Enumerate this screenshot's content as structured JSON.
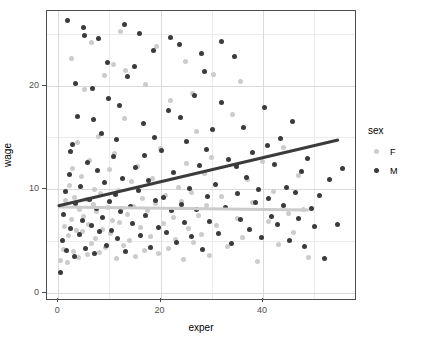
{
  "chart_data": {
    "type": "scatter",
    "title": "",
    "xlabel": "exper",
    "ylabel": "wage",
    "xlim": [
      -2.2,
      58
    ],
    "ylim": [
      -0.6,
      27.2
    ],
    "x_ticks": [
      0,
      20,
      40
    ],
    "y_ticks": [
      0,
      10,
      20
    ],
    "x_minor_ticks": [
      10,
      30,
      50
    ],
    "y_minor_ticks": [
      5,
      15,
      25
    ],
    "grid": true,
    "legend": {
      "title": "sex",
      "position": "right",
      "entries": [
        {
          "label": "F",
          "color": "#cccccc"
        },
        {
          "label": "M",
          "color": "#3b3b3b"
        }
      ]
    },
    "series": [
      {
        "name": "F",
        "color": "#cccccc",
        "fit_line": {
          "x0": 0,
          "y0": 8.3,
          "x1": 49,
          "y1": 8.0,
          "color": "#cccccc"
        },
        "points": [
          [
            0.5,
            3.1
          ],
          [
            1.0,
            4.2
          ],
          [
            1.2,
            6.4
          ],
          [
            1.5,
            8.9
          ],
          [
            1.8,
            2.9
          ],
          [
            2.0,
            5.5
          ],
          [
            2.2,
            10.4
          ],
          [
            2.5,
            7.1
          ],
          [
            2.8,
            12.0
          ],
          [
            3.0,
            4.0
          ],
          [
            3.2,
            9.2
          ],
          [
            3.5,
            6.0
          ],
          [
            3.8,
            14.5
          ],
          [
            4.0,
            3.4
          ],
          [
            4.2,
            8.0
          ],
          [
            4.5,
            11.2
          ],
          [
            4.8,
            5.9
          ],
          [
            5.0,
            7.4
          ],
          [
            5.2,
            19.6
          ],
          [
            5.5,
            9.0
          ],
          [
            5.8,
            3.7
          ],
          [
            6.0,
            6.6
          ],
          [
            6.2,
            12.8
          ],
          [
            6.5,
            4.8
          ],
          [
            6.8,
            8.5
          ],
          [
            7.0,
            10.0
          ],
          [
            7.2,
            5.2
          ],
          [
            7.5,
            7.8
          ],
          [
            7.8,
            15.1
          ],
          [
            8.0,
            3.9
          ],
          [
            8.3,
            9.6
          ],
          [
            8.6,
            6.1
          ],
          [
            9.0,
            21.0
          ],
          [
            9.3,
            4.4
          ],
          [
            9.6,
            8.2
          ],
          [
            10.0,
            11.9
          ],
          [
            10.3,
            5.7
          ],
          [
            10.6,
            7.0
          ],
          [
            11.0,
            13.4
          ],
          [
            11.4,
            3.3
          ],
          [
            11.8,
            9.9
          ],
          [
            12.0,
            6.8
          ],
          [
            12.4,
            8.1
          ],
          [
            12.8,
            4.6
          ],
          [
            13.0,
            16.8
          ],
          [
            13.5,
            7.6
          ],
          [
            14.0,
            5.0
          ],
          [
            14.4,
            10.7
          ],
          [
            14.8,
            8.3
          ],
          [
            15.0,
            3.5
          ],
          [
            15.5,
            12.2
          ],
          [
            16.0,
            6.3
          ],
          [
            16.4,
            9.1
          ],
          [
            16.8,
            4.1
          ],
          [
            17.0,
            20.1
          ],
          [
            17.5,
            7.9
          ],
          [
            18.0,
            5.4
          ],
          [
            18.5,
            11.0
          ],
          [
            19.0,
            8.6
          ],
          [
            19.5,
            3.8
          ],
          [
            20.0,
            13.9
          ],
          [
            20.5,
            6.7
          ],
          [
            21.0,
            9.4
          ],
          [
            21.5,
            4.3
          ],
          [
            22.0,
            18.6
          ],
          [
            22.5,
            7.3
          ],
          [
            23.0,
            5.1
          ],
          [
            23.5,
            10.2
          ],
          [
            24.0,
            8.8
          ],
          [
            24.5,
            3.2
          ],
          [
            25.0,
            12.5
          ],
          [
            25.5,
            6.2
          ],
          [
            26.0,
            9.7
          ],
          [
            26.5,
            4.9
          ],
          [
            27.0,
            15.6
          ],
          [
            27.5,
            7.5
          ],
          [
            28.0,
            5.6
          ],
          [
            28.5,
            11.5
          ],
          [
            29.0,
            8.4
          ],
          [
            29.5,
            3.6
          ],
          [
            30.0,
            13.1
          ],
          [
            31.0,
            6.5
          ],
          [
            32.0,
            9.3
          ],
          [
            33.0,
            4.5
          ],
          [
            34.0,
            17.2
          ],
          [
            35.0,
            7.2
          ],
          [
            36.0,
            5.3
          ],
          [
            37.0,
            10.9
          ],
          [
            38.0,
            8.7
          ],
          [
            39.0,
            3.0
          ],
          [
            40.0,
            12.7
          ],
          [
            41.0,
            6.9
          ],
          [
            42.0,
            9.8
          ],
          [
            43.0,
            4.7
          ],
          [
            44.0,
            14.0
          ],
          [
            45.0,
            7.7
          ],
          [
            46.0,
            5.8
          ],
          [
            47.0,
            11.3
          ],
          [
            48.0,
            8.0
          ],
          [
            49.0,
            3.4
          ],
          [
            2.6,
            22.6
          ],
          [
            6.4,
            24.2
          ],
          [
            10.8,
            22.0
          ],
          [
            13.2,
            21.5
          ],
          [
            19.2,
            23.8
          ],
          [
            24.8,
            22.3
          ],
          [
            30.4,
            21.1
          ],
          [
            35.6,
            20.4
          ],
          [
            12.2,
            25.2
          ],
          [
            26.2,
            19.2
          ]
        ]
      },
      {
        "name": "M",
        "color": "#3b3b3b",
        "fit_line": {
          "x0": 0,
          "y0": 8.4,
          "x1": 55,
          "y1": 14.8,
          "color": "#3b3b3b"
        },
        "points": [
          [
            0.4,
            2.0
          ],
          [
            0.8,
            5.0
          ],
          [
            1.1,
            7.6
          ],
          [
            1.4,
            9.8
          ],
          [
            1.7,
            4.1
          ],
          [
            2.1,
            11.4
          ],
          [
            2.4,
            6.2
          ],
          [
            2.7,
            14.3
          ],
          [
            3.1,
            3.5
          ],
          [
            3.4,
            8.6
          ],
          [
            3.7,
            17.0
          ],
          [
            4.1,
            5.6
          ],
          [
            4.4,
            10.3
          ],
          [
            4.7,
            7.0
          ],
          [
            5.1,
            24.8
          ],
          [
            5.4,
            4.3
          ],
          [
            5.7,
            12.6
          ],
          [
            6.1,
            9.0
          ],
          [
            6.4,
            6.5
          ],
          [
            6.7,
            19.7
          ],
          [
            7.1,
            3.8
          ],
          [
            7.4,
            8.1
          ],
          [
            7.7,
            11.8
          ],
          [
            8.1,
            5.9
          ],
          [
            8.4,
            15.4
          ],
          [
            8.7,
            7.3
          ],
          [
            9.1,
            10.6
          ],
          [
            9.4,
            4.6
          ],
          [
            9.7,
            22.2
          ],
          [
            10.1,
            8.8
          ],
          [
            10.4,
            6.0
          ],
          [
            10.8,
            13.2
          ],
          [
            11.1,
            9.5
          ],
          [
            11.5,
            5.2
          ],
          [
            11.9,
            18.1
          ],
          [
            12.2,
            7.8
          ],
          [
            12.6,
            11.0
          ],
          [
            13.1,
            4.0
          ],
          [
            13.6,
            20.9
          ],
          [
            14.1,
            8.3
          ],
          [
            14.6,
            6.7
          ],
          [
            15.1,
            12.1
          ],
          [
            15.6,
            9.9
          ],
          [
            16.1,
            5.5
          ],
          [
            16.6,
            16.3
          ],
          [
            17.1,
            7.5
          ],
          [
            17.6,
            10.8
          ],
          [
            18.1,
            4.4
          ],
          [
            18.6,
            23.4
          ],
          [
            19.1,
            8.9
          ],
          [
            19.6,
            6.3
          ],
          [
            20.1,
            13.7
          ],
          [
            20.6,
            9.2
          ],
          [
            21.1,
            5.8
          ],
          [
            21.6,
            17.6
          ],
          [
            22.1,
            7.9
          ],
          [
            22.6,
            11.6
          ],
          [
            23.1,
            4.9
          ],
          [
            23.6,
            24.0
          ],
          [
            24.1,
            8.5
          ],
          [
            24.6,
            6.8
          ],
          [
            25.1,
            14.6
          ],
          [
            25.6,
            10.1
          ],
          [
            26.1,
            5.4
          ],
          [
            26.6,
            19.0
          ],
          [
            27.1,
            8.0
          ],
          [
            27.6,
            12.3
          ],
          [
            28.1,
            4.2
          ],
          [
            28.6,
            21.4
          ],
          [
            29.1,
            9.3
          ],
          [
            29.6,
            6.9
          ],
          [
            30.2,
            15.8
          ],
          [
            30.8,
            10.5
          ],
          [
            31.4,
            5.7
          ],
          [
            32.0,
            18.4
          ],
          [
            32.6,
            8.2
          ],
          [
            33.2,
            12.9
          ],
          [
            33.8,
            4.8
          ],
          [
            34.4,
            22.8
          ],
          [
            35.0,
            9.6
          ],
          [
            35.6,
            7.1
          ],
          [
            36.2,
            16.0
          ],
          [
            36.8,
            11.1
          ],
          [
            37.4,
            6.1
          ],
          [
            38.0,
            13.5
          ],
          [
            38.6,
            8.7
          ],
          [
            39.2,
            10.0
          ],
          [
            39.8,
            5.3
          ],
          [
            40.4,
            17.9
          ],
          [
            41.0,
            9.1
          ],
          [
            41.6,
            7.4
          ],
          [
            42.2,
            12.4
          ],
          [
            42.8,
            6.6
          ],
          [
            43.4,
            14.9
          ],
          [
            44.0,
            8.4
          ],
          [
            44.6,
            10.2
          ],
          [
            45.2,
            5.0
          ],
          [
            45.8,
            16.5
          ],
          [
            46.4,
            9.7
          ],
          [
            47.0,
            7.2
          ],
          [
            47.6,
            11.7
          ],
          [
            48.2,
            4.5
          ],
          [
            48.8,
            13.0
          ],
          [
            49.4,
            8.1
          ],
          [
            50.0,
            6.4
          ],
          [
            51.0,
            9.4
          ],
          [
            52.0,
            3.3
          ],
          [
            53.0,
            10.9
          ],
          [
            54.5,
            6.6
          ],
          [
            55.5,
            12.0
          ],
          [
            1.9,
            26.3
          ],
          [
            4.9,
            25.6
          ],
          [
            7.9,
            24.5
          ],
          [
            12.9,
            25.9
          ],
          [
            15.9,
            25.0
          ],
          [
            21.9,
            24.6
          ],
          [
            27.9,
            23.1
          ],
          [
            31.9,
            24.3
          ],
          [
            3.3,
            20.2
          ],
          [
            9.9,
            18.8
          ],
          [
            14.9,
            21.8
          ],
          [
            18.9,
            15.0
          ],
          [
            23.9,
            16.9
          ],
          [
            28.9,
            13.8
          ],
          [
            34.9,
            12.2
          ],
          [
            40.9,
            14.2
          ],
          [
            2.3,
            13.6
          ],
          [
            6.9,
            16.7
          ],
          [
            11.4,
            14.8
          ],
          [
            16.9,
            13.3
          ]
        ]
      }
    ]
  }
}
